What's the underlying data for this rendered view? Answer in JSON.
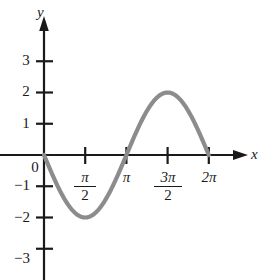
{
  "chart_data": {
    "type": "line",
    "title": "",
    "subtitle": "",
    "xlabel": "x",
    "ylabel": "y",
    "function": "y = -2 sin(x)",
    "amplitude": 2,
    "period": "2π",
    "xlim": [
      -0.35,
      6.9
    ],
    "ylim": [
      -3.6,
      3.4
    ],
    "grid": false,
    "legend": null,
    "curve_color": "#8c8c8c",
    "axis_color": "#1a1a1a",
    "x_ticks": [
      {
        "value": 1.5708,
        "label": "π/2",
        "num": "π",
        "den": "2",
        "is_fraction": true
      },
      {
        "value": 3.1416,
        "label": "π",
        "num": "π",
        "den": "",
        "is_fraction": false
      },
      {
        "value": 4.7124,
        "label": "3π/2",
        "num": "3π",
        "den": "2",
        "is_fraction": true
      },
      {
        "value": 6.2832,
        "label": "2π",
        "num": "2π",
        "den": "",
        "is_fraction": false
      }
    ],
    "y_ticks": [
      {
        "value": 3,
        "label": "3"
      },
      {
        "value": 2,
        "label": "2"
      },
      {
        "value": 1,
        "label": "1"
      },
      {
        "value": -1,
        "label": "−1"
      },
      {
        "value": -2,
        "label": "−2"
      },
      {
        "value": -3,
        "label": "−3"
      }
    ],
    "origin_label": "0",
    "points": [
      {
        "x": 0,
        "y": 0
      },
      {
        "x": 1.5708,
        "y": -2
      },
      {
        "x": 3.1416,
        "y": 0
      },
      {
        "x": 4.7124,
        "y": 2
      },
      {
        "x": 6.2832,
        "y": 0
      }
    ],
    "annotations": []
  },
  "axes": {
    "x_axis_label": "x",
    "y_axis_label": "y"
  },
  "icons": {
    "x_arrow": "arrow-right-icon",
    "y_arrow": "arrow-up-icon"
  }
}
